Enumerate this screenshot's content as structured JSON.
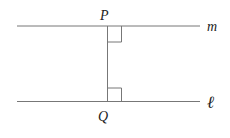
{
  "diagram": {
    "type": "parallel lines with common perpendicular",
    "colors": {
      "line": "#777777",
      "label": "#222222",
      "background": "#ffffff"
    },
    "lines": [
      {
        "name": "m",
        "label": "m"
      },
      {
        "name": "l",
        "label": "ℓ"
      }
    ],
    "points": [
      {
        "name": "P",
        "label": "P"
      },
      {
        "name": "Q",
        "label": "Q"
      }
    ],
    "right_angles": [
      "at P",
      "at Q"
    ]
  }
}
